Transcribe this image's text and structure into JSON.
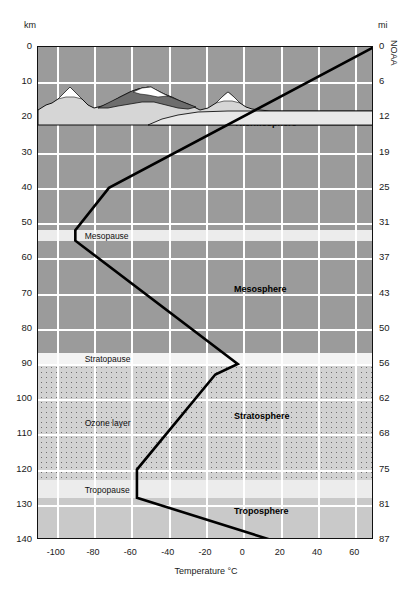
{
  "axes": {
    "left_unit": "km",
    "right_unit": "mi",
    "x_title": "Temperature °C"
  },
  "credit": "NOAA",
  "chart_data": {
    "type": "line",
    "xlabel": "Temperature °C",
    "ylabel": "km",
    "ylabel_right": "mi",
    "xlim": [
      -110,
      70
    ],
    "ylim": [
      0,
      140
    ],
    "grid": true,
    "legend": "none",
    "x_ticks": [
      -100,
      -80,
      -60,
      -40,
      -20,
      0,
      20,
      40,
      60
    ],
    "y_ticks_km": [
      0,
      10,
      20,
      30,
      40,
      50,
      60,
      70,
      80,
      90,
      100,
      110,
      120,
      130,
      140
    ],
    "y_ticks_mi": [
      0,
      6,
      12,
      19,
      25,
      31,
      37,
      43,
      50,
      56,
      62,
      68,
      75,
      81,
      87
    ],
    "series": [
      {
        "name": "Temperature",
        "points": [
          {
            "t": 15,
            "km": 0
          },
          {
            "t": -57,
            "km": 12
          },
          {
            "t": -57,
            "km": 20
          },
          {
            "t": -15,
            "km": 47
          },
          {
            "t": -3,
            "km": 50
          },
          {
            "t": -90,
            "km": 85
          },
          {
            "t": -90,
            "km": 88
          },
          {
            "t": -72,
            "km": 100
          },
          {
            "t": 70,
            "km": 140
          }
        ],
        "arrow_end": true
      }
    ],
    "bands": [
      {
        "name": "Troposphere",
        "from_km": 0,
        "to_km": 12,
        "kind": "layer"
      },
      {
        "name": "Tropopause",
        "from_km": 12,
        "to_km": 17,
        "kind": "pause"
      },
      {
        "name": "Stratosphere",
        "from_km": 17,
        "to_km": 50,
        "kind": "layer"
      },
      {
        "name": "Stratopause",
        "from_km": 50,
        "to_km": 53,
        "kind": "pause"
      },
      {
        "name": "Mesosphere",
        "from_km": 53,
        "to_km": 85,
        "kind": "layer"
      },
      {
        "name": "Mesopause",
        "from_km": 85,
        "to_km": 88,
        "kind": "pause"
      },
      {
        "name": "Thermosphere",
        "from_km": 88,
        "to_km": 140,
        "kind": "layer"
      }
    ],
    "annotations": [
      {
        "text": "Ozone layer",
        "t": -85,
        "km": 33
      },
      {
        "text": "Mesopause",
        "t": -85,
        "km": 86
      },
      {
        "text": "Stratopause",
        "t": -85,
        "km": 51
      },
      {
        "text": "Tropopause",
        "t": -85,
        "km": 14
      },
      {
        "text": "Thermosphere",
        "t": -5,
        "km": 118
      },
      {
        "text": "Mesosphere",
        "t": -5,
        "km": 71
      },
      {
        "text": "Stratosphere",
        "t": -5,
        "km": 35
      },
      {
        "text": "Troposphere",
        "t": -5,
        "km": 8
      }
    ]
  },
  "labels": {
    "ozone_layer": "Ozone layer",
    "mesopause": "Mesopause",
    "stratopause": "Stratopause",
    "tropopause": "Tropopause",
    "thermosphere": "Thermosphere",
    "mesosphere": "Mesosphere",
    "stratosphere": "Stratosphere",
    "troposphere": "Troposphere"
  },
  "ticks": {
    "km": [
      "140",
      "130",
      "120",
      "110",
      "100",
      "90",
      "80",
      "70",
      "60",
      "50",
      "40",
      "30",
      "20",
      "10",
      "0"
    ],
    "mi": [
      "87",
      "81",
      "75",
      "68",
      "62",
      "56",
      "50",
      "43",
      "37",
      "31",
      "25",
      "19",
      "12",
      "6",
      "0"
    ],
    "temp": [
      "-100",
      "-80",
      "-60",
      "-40",
      "-20",
      "0",
      "20",
      "40",
      "60"
    ]
  }
}
